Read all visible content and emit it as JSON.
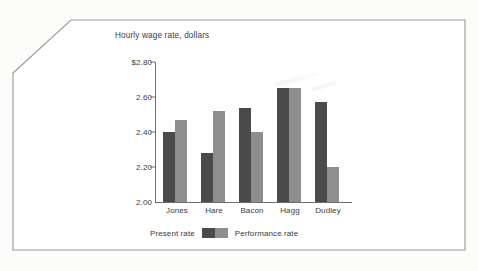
{
  "chart_data": {
    "type": "bar",
    "title": "Hourly wage rate, dollars",
    "xlabel": "",
    "ylabel": "",
    "ylim": [
      2.0,
      2.8
    ],
    "ytick_labels": [
      "$2.80",
      "2.60",
      "2.40",
      "2.20",
      "2.00"
    ],
    "ytick_values": [
      2.8,
      2.6,
      2.4,
      2.2,
      2.0
    ],
    "grid": false,
    "legend_position": "bottom-left",
    "categories": [
      "Jones",
      "Hare",
      "Bacon",
      "Hagg",
      "Dudley"
    ],
    "series": [
      {
        "name": "Present rate",
        "color": "#4a4a4a",
        "values": [
          2.4,
          2.28,
          2.54,
          2.65,
          2.57
        ]
      },
      {
        "name": "Performance rate",
        "color": "#8e8e8e",
        "values": [
          2.47,
          2.52,
          2.4,
          2.65,
          2.2
        ]
      }
    ]
  },
  "legend": {
    "present_label": "Present rate",
    "performance_label": "Performance rate"
  },
  "colors": {
    "present": "#4a4a4a",
    "performance": "#8e8e8e",
    "axis": "#6e6e6e",
    "text": "#3b3b3b",
    "frame": "#9a9a9a",
    "background": "#ffffff"
  }
}
